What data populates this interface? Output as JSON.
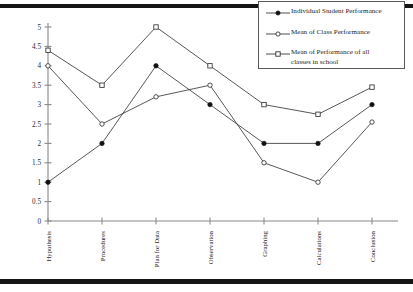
{
  "chart_data": {
    "type": "line",
    "title": "",
    "xlabel": "",
    "ylabel": "",
    "ylim": [
      0,
      5
    ],
    "ytick_step": 0.5,
    "grid": false,
    "legend_position": "top-right",
    "categories": [
      "Hypothesis",
      "Procedures",
      "Plan for Data",
      "Observation",
      "Graphing",
      "Calculations",
      "Conclusion"
    ],
    "yticks": [
      "0",
      "0.5",
      "1",
      "1.5",
      "2",
      "2.5",
      "3",
      "3.5",
      "4",
      "4.5",
      "5"
    ],
    "series": [
      {
        "name": "Individual Student Performance",
        "marker": "filled-circle",
        "values": [
          1,
          2,
          4,
          3,
          2,
          2,
          3
        ]
      },
      {
        "name": "Mean of Class Performance",
        "marker": "open-circle",
        "values": [
          4,
          2.5,
          3.2,
          3.5,
          1.5,
          1,
          2.55
        ]
      },
      {
        "name": "Mean of Performance of all\nclasses in school",
        "marker": "open-square",
        "values": [
          4.4,
          3.5,
          5,
          4,
          3,
          2.75,
          3.45
        ]
      }
    ]
  },
  "legend": {
    "items": [
      {
        "label": "Individual Student Performance",
        "marker": "filled-circle"
      },
      {
        "label": "Mean of Class Performance",
        "marker": "open-circle"
      },
      {
        "label": "Mean of Performance of all\nclasses in school",
        "marker": "open-square"
      }
    ]
  },
  "colors": {
    "line": "#3a3a3a",
    "marker_fill": "#111111",
    "marker_open": "#ffffff",
    "axis": "#8a8a8a",
    "rule": "#141414",
    "text": "#1d1d1d",
    "background": "#ffffff"
  }
}
